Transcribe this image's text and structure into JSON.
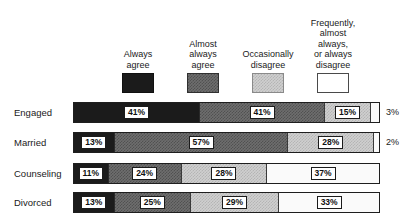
{
  "chart_data": {
    "type": "bar",
    "subtype": "stacked-horizontal-100pct",
    "title": "",
    "subtitle": "",
    "xlabel": "",
    "ylabel": "",
    "xlim": [
      0,
      100
    ],
    "grid": false,
    "legend_position": "top",
    "categories": [
      "Engaged",
      "Married",
      "Counseling",
      "Divorced"
    ],
    "series": [
      {
        "name": "Always agree",
        "values": [
          41,
          13,
          11,
          13
        ],
        "color": "#1b1b1b"
      },
      {
        "name": "Almost always agree",
        "values": [
          41,
          57,
          24,
          25
        ],
        "color": "#6e6e6e"
      },
      {
        "name": "Occasionally disagree",
        "values": [
          15,
          28,
          28,
          29
        ],
        "color": "#cfcfcf"
      },
      {
        "name": "Frequently, almost always, or always disagree",
        "values": [
          3,
          2,
          37,
          33
        ],
        "color": "#ffffff"
      }
    ],
    "value_label_format": "{v}%",
    "outside_labels": {
      "Engaged": "3%",
      "Married": "2%"
    }
  },
  "legend": {
    "items": [
      {
        "label": "Always\nagree",
        "swatch": "legend-swatch-always-agree"
      },
      {
        "label": "Almost\nalways\nagree",
        "swatch": "legend-swatch-almost-always-agree"
      },
      {
        "label": "Occasionally\ndisagree",
        "swatch": "legend-swatch-occasionally-disagree"
      },
      {
        "label": "Frequently,\nalmost\nalways,\nor always\ndisagree",
        "swatch": "legend-swatch-frequently-disagree"
      }
    ]
  },
  "rows": [
    {
      "label": "Engaged",
      "segments": [
        {
          "value": "41%",
          "pct": 41
        },
        {
          "value": "41%",
          "pct": 41
        },
        {
          "value": "15%",
          "pct": 15
        },
        {
          "value": "3%",
          "pct": 3
        }
      ],
      "outside": "3%"
    },
    {
      "label": "Married",
      "segments": [
        {
          "value": "13%",
          "pct": 13
        },
        {
          "value": "57%",
          "pct": 57
        },
        {
          "value": "28%",
          "pct": 28
        },
        {
          "value": "2%",
          "pct": 2
        }
      ],
      "outside": "2%"
    },
    {
      "label": "Counseling",
      "segments": [
        {
          "value": "11%",
          "pct": 11
        },
        {
          "value": "24%",
          "pct": 24
        },
        {
          "value": "28%",
          "pct": 28
        },
        {
          "value": "37%",
          "pct": 37
        }
      ],
      "outside": ""
    },
    {
      "label": "Divorced",
      "segments": [
        {
          "value": "13%",
          "pct": 13
        },
        {
          "value": "25%",
          "pct": 25
        },
        {
          "value": "29%",
          "pct": 29
        },
        {
          "value": "33%",
          "pct": 33
        }
      ],
      "outside": ""
    }
  ]
}
